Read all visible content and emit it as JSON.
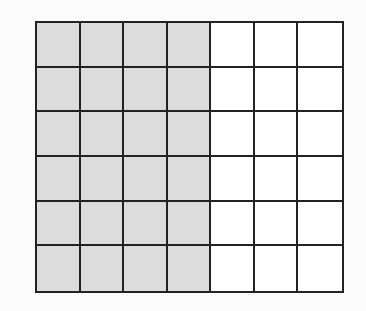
{
  "figure": {
    "type": "grid",
    "rows": 6,
    "columns": 7,
    "shaded_columns": 4,
    "shaded_cells": 24,
    "total_cells": 42,
    "colors": {
      "shaded": "#dcdcdc",
      "unshaded": "#ffffff",
      "lines": "#222222",
      "background": "#fbfbfb"
    }
  }
}
